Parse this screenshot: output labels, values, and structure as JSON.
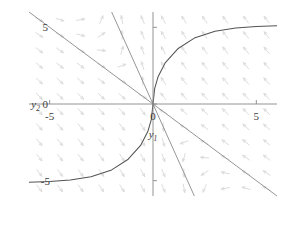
{
  "chart_data": {
    "type": "line",
    "title": "",
    "subtitle": "",
    "xlabel": "y1",
    "ylabel": "y2",
    "xlabel_base": "y",
    "xlabel_sub": "1",
    "ylabel_base": "y",
    "ylabel_sub": "2",
    "xlim": [
      -6,
      6
    ],
    "ylim": [
      -6,
      6
    ],
    "grid": false,
    "legend": null,
    "legend_position": "none",
    "xticks": [
      -5,
      0,
      5
    ],
    "xtick_labels": [
      "-5",
      "0",
      "5"
    ],
    "yticks": [
      -5,
      0,
      5
    ],
    "ytick_labels": [
      "-5",
      "0",
      "5"
    ],
    "plot_description": "phase portrait with saddle point at origin, light gray direction field arrows, two straight separatrix lines and one S-shaped trajectory",
    "colors": {
      "arrow": "#d8d8d8",
      "curve": "#545454",
      "separatrix": "#8a8a8a",
      "axis": "#888888",
      "text": "#3b3b3b",
      "background": "#ffffff"
    },
    "series": [
      {
        "name": "separatrix-slow",
        "kind": "straight-line",
        "slope": -1.0,
        "intercept": 0,
        "x": [
          -6,
          6
        ],
        "values": [
          6,
          -6
        ]
      },
      {
        "name": "separatrix-fast",
        "kind": "straight-line",
        "slope": -3.0,
        "intercept": 0,
        "x": [
          -2,
          2
        ],
        "values": [
          6,
          -6
        ]
      },
      {
        "name": "trajectory",
        "kind": "curve",
        "x": [
          -6,
          -5,
          -4,
          -3,
          -2,
          -1.2,
          -0.6,
          -0.25,
          -0.08,
          0,
          0.08,
          0.25,
          0.6,
          1.2,
          2,
          3,
          4,
          5,
          6
        ],
        "values": [
          -5.1,
          -5.05,
          -4.95,
          -4.75,
          -4.3,
          -3.6,
          -2.7,
          -1.8,
          -1.0,
          0,
          1.0,
          1.8,
          2.7,
          3.6,
          4.3,
          4.75,
          4.95,
          5.05,
          5.1
        ]
      }
    ],
    "vector_field": {
      "description": "arrows point rightward below the anti-diagonal and leftward above it; directions rotate toward the separatrix lines",
      "grid_x": [
        -5.5,
        -4.5,
        -3.5,
        -2.5,
        -1.5,
        -0.5,
        0.5,
        1.5,
        2.5,
        3.5,
        4.5,
        5.5
      ],
      "grid_y": [
        -5.5,
        -4.5,
        -3.5,
        -2.5,
        -1.5,
        -0.5,
        0.5,
        1.5,
        2.5,
        3.5,
        4.5,
        5.5
      ]
    }
  }
}
